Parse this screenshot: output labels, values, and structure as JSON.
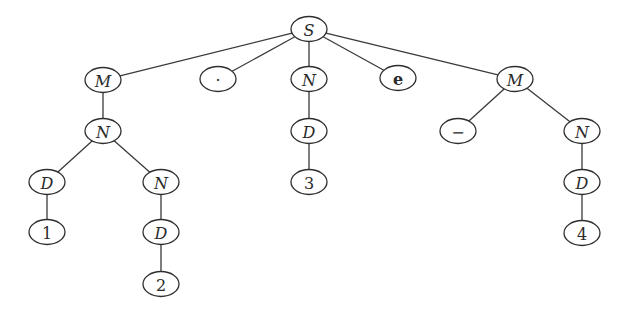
{
  "diagram": {
    "type": "tree",
    "colors": {
      "background": "#ffffff",
      "stroke": "#2e2e2e",
      "text": "#2a2a2a"
    },
    "node_size": {
      "rx": 18,
      "ry": 12.5
    },
    "nodes": [
      {
        "id": "S",
        "label": "S",
        "style": "italic",
        "x": 309,
        "y": 29
      },
      {
        "id": "M1",
        "label": "M",
        "style": "italic",
        "x": 103,
        "y": 80
      },
      {
        "id": "dot",
        "label": "·",
        "style": "normal",
        "x": 218,
        "y": 79
      },
      {
        "id": "N1",
        "label": "N",
        "style": "italic",
        "x": 309,
        "y": 79
      },
      {
        "id": "e",
        "label": "e",
        "style": "bold",
        "x": 398,
        "y": 78
      },
      {
        "id": "M2",
        "label": "M",
        "style": "italic",
        "x": 515,
        "y": 79
      },
      {
        "id": "N2",
        "label": "N",
        "style": "italic",
        "x": 103,
        "y": 131
      },
      {
        "id": "D1",
        "label": "D",
        "style": "italic",
        "x": 309,
        "y": 131
      },
      {
        "id": "minus",
        "label": "−",
        "style": "normal",
        "x": 458,
        "y": 131
      },
      {
        "id": "N3",
        "label": "N",
        "style": "italic",
        "x": 582,
        "y": 131
      },
      {
        "id": "D2",
        "label": "D",
        "style": "italic",
        "x": 47,
        "y": 182
      },
      {
        "id": "N4",
        "label": "N",
        "style": "italic",
        "x": 161,
        "y": 182
      },
      {
        "id": "three",
        "label": "3",
        "style": "normal",
        "x": 309,
        "y": 182
      },
      {
        "id": "D3",
        "label": "D",
        "style": "italic",
        "x": 582,
        "y": 182
      },
      {
        "id": "one",
        "label": "1",
        "style": "normal",
        "x": 47,
        "y": 232
      },
      {
        "id": "D4",
        "label": "D",
        "style": "italic",
        "x": 161,
        "y": 232
      },
      {
        "id": "four",
        "label": "4",
        "style": "normal",
        "x": 582,
        "y": 233
      },
      {
        "id": "two",
        "label": "2",
        "style": "normal",
        "x": 161,
        "y": 284
      }
    ],
    "edges": [
      [
        "S",
        "M1"
      ],
      [
        "S",
        "dot"
      ],
      [
        "S",
        "N1"
      ],
      [
        "S",
        "e"
      ],
      [
        "S",
        "M2"
      ],
      [
        "M1",
        "N2"
      ],
      [
        "N2",
        "D2"
      ],
      [
        "N2",
        "N4"
      ],
      [
        "D2",
        "one"
      ],
      [
        "N4",
        "D4"
      ],
      [
        "D4",
        "two"
      ],
      [
        "N1",
        "D1"
      ],
      [
        "D1",
        "three"
      ],
      [
        "M2",
        "minus"
      ],
      [
        "M2",
        "N3"
      ],
      [
        "N3",
        "D3"
      ],
      [
        "D3",
        "four"
      ]
    ]
  }
}
